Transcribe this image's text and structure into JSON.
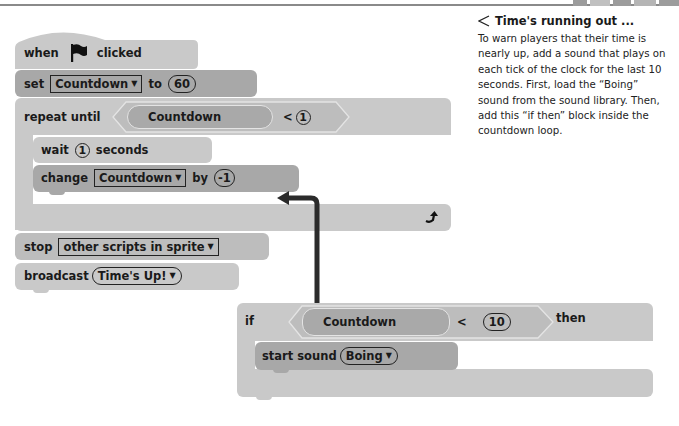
{
  "page": {
    "top_border": true
  },
  "script_main": {
    "hat": {
      "when": "when",
      "icon": "green-flag-icon",
      "clicked": "clicked"
    },
    "set_block": {
      "label": "set",
      "variable": "Countdown",
      "to": "to",
      "value": "60"
    },
    "repeat_block": {
      "label": "repeat until",
      "condition": {
        "variable": "Countdown",
        "operator": "<",
        "value": "1"
      },
      "inner": [
        {
          "label": "wait",
          "value": "1",
          "suffix": "seconds"
        },
        {
          "label": "change",
          "variable": "Countdown",
          "by": "by",
          "value": "-1"
        }
      ],
      "loop_icon": "loop-arrow-icon"
    },
    "stop_block": {
      "label": "stop",
      "option": "other scripts in sprite"
    },
    "broadcast_block": {
      "label": "broadcast",
      "message": "Time's Up!"
    }
  },
  "if_script": {
    "label": "if",
    "condition": {
      "variable": "Countdown",
      "operator": "<",
      "value": "10"
    },
    "then": "then",
    "inner": {
      "label": "start sound",
      "sound": "Boing"
    }
  },
  "callout": {
    "title": "Time's running out ...",
    "title_icon": "triangle-left-icon",
    "body": "To warn players that their time is nearly up, add a sound that plays on each tick of the clock for the last 10 seconds. First, load the “Boing” sound from the sound library. Then, add this “if then” block inside the countdown loop."
  },
  "colors": {
    "block_light": "#c9c9c9",
    "block_mid": "#bdbdbd",
    "block_dark": "#a8a8a8",
    "arrow": "#2b2b2b",
    "text": "#1a1a1a"
  }
}
